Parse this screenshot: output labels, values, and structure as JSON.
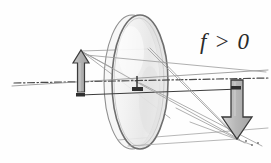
{
  "figure": {
    "name": "thin-converging-lens-ray-diagram",
    "background_color": "#fefefe"
  },
  "annotations": {
    "focal_condition": "f > 0",
    "focal_condition_color": "#2b2b2b"
  },
  "optical_axis": {
    "name": "optical-axis",
    "style": "dash-dot",
    "color": "#4a4a4a",
    "x1": 14,
    "y1": 83,
    "x2": 268,
    "y2": 78
  },
  "ground_line": {
    "name": "perspective-base-line",
    "color": "#3c3c3c",
    "x1": 80,
    "y1": 95,
    "x2": 240,
    "y2": 89
  },
  "lens": {
    "name": "converging-lens-disc",
    "shape": "ellipse",
    "center_x": 140,
    "center_y": 82,
    "radius_x": 28,
    "radius_y": 67,
    "rim_offset_x": 8,
    "body_fill": "#f5f5f5",
    "body_fill_2": "#ebebeb",
    "rim_color": "#6e6e6e",
    "edge_color": "#8a8a8a"
  },
  "lens_center_marker": {
    "name": "lens-center-pedestal",
    "color": "#2f2f2f",
    "x": 137,
    "y_top": 76,
    "y_bottom": 90
  },
  "object_arrow": {
    "name": "object-arrow",
    "direction": "up",
    "fill": "#b5b5b5",
    "stroke": "#3a3a3a",
    "base_x": 81,
    "base_y": 92,
    "tip_y": 50,
    "shaft_half_width": 3.5,
    "head_half_width": 8,
    "head_height": 13
  },
  "image_arrow": {
    "name": "image-arrow",
    "direction": "down",
    "fill": "#b9b9b9",
    "stroke": "#3a3a3a",
    "base_x": 237,
    "base_y": 80,
    "tip_y": 139,
    "shaft_half_width": 6,
    "head_half_width": 15,
    "head_height": 22
  },
  "rays": {
    "name": "light-rays",
    "color": "#9a9a9a",
    "color_dark": "#7d7d7d",
    "width": 0.8,
    "list": [
      {
        "name": "ray-parallel-upper",
        "x1": 81,
        "y1": 51,
        "x2": 148,
        "y2": 49
      },
      {
        "name": "ray-parallel-to-image",
        "x1": 148,
        "y1": 49,
        "x2": 237,
        "y2": 138
      },
      {
        "name": "ray-through-center",
        "x1": 81,
        "y1": 51,
        "x2": 237,
        "y2": 138
      },
      {
        "name": "ray-focal-incident",
        "x1": 81,
        "y1": 51,
        "x2": 140,
        "y2": 83
      },
      {
        "name": "ray-focal-exit",
        "x1": 140,
        "y1": 83,
        "x2": 262,
        "y2": 146
      },
      {
        "name": "ray-lower-aux-1",
        "x1": 81,
        "y1": 51,
        "x2": 170,
        "y2": 118
      },
      {
        "name": "ray-lower-aux-2",
        "x1": 86,
        "y1": 55,
        "x2": 266,
        "y2": 72
      },
      {
        "name": "ray-base-long",
        "x1": 118,
        "y1": 140,
        "x2": 268,
        "y2": 128
      },
      {
        "name": "ray-lens-bottom-to-image",
        "x1": 128,
        "y1": 146,
        "x2": 237,
        "y2": 139
      },
      {
        "name": "ray-upper-skim",
        "x1": 12,
        "y1": 86,
        "x2": 268,
        "y2": 70
      },
      {
        "name": "ray-converge-a",
        "x1": 150,
        "y1": 48,
        "x2": 240,
        "y2": 140
      },
      {
        "name": "ray-converge-b",
        "x1": 176,
        "y1": 108,
        "x2": 245,
        "y2": 143
      },
      {
        "name": "ray-converge-c",
        "x1": 190,
        "y1": 122,
        "x2": 252,
        "y2": 145
      }
    ]
  }
}
